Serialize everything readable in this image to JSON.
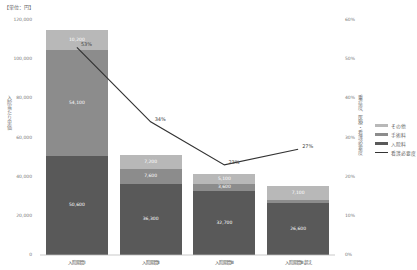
{
  "chart_data": {
    "type": "bar+line",
    "title": "",
    "unit_label": "【単位：円】",
    "ylabel": "入院当たり単価",
    "ylabel_right": "重症度、医療・看護必要度",
    "ylim": [
      0,
      120000
    ],
    "ylim_right": [
      0,
      0.6
    ],
    "yticks": [
      "0",
      "20,000",
      "40,000",
      "60,000",
      "80,000",
      "100,000",
      "120,000"
    ],
    "yticks_right": [
      "0%",
      "10%",
      "20%",
      "30%",
      "40%",
      "50%",
      "60%"
    ],
    "categories": [
      "入院期間Ⅰ",
      "入院期間Ⅱ",
      "入院期間Ⅲ",
      "入院期間Ⅲ超え"
    ],
    "series": [
      {
        "name": "入院料",
        "type": "bar",
        "stack": true,
        "color": "#595959",
        "values": [
          50600,
          36300,
          32700,
          26600
        ],
        "labels": [
          "50,600",
          "36,300",
          "32,700",
          "26,600"
        ]
      },
      {
        "name": "手術料",
        "type": "bar",
        "stack": true,
        "color": "#8c8c8c",
        "values": [
          54100,
          7600,
          3600,
          1500
        ],
        "labels": [
          "54,100",
          "7,600",
          "3,600",
          "1,500"
        ]
      },
      {
        "name": "その他",
        "type": "bar",
        "stack": true,
        "color": "#b8b8b8",
        "values": [
          10200,
          7200,
          5100,
          7100
        ],
        "labels": [
          "10,200",
          "7,200",
          "5,100",
          "7,100"
        ]
      },
      {
        "name": "看護必要度",
        "type": "line",
        "axis": "right",
        "color": "#333333",
        "values": [
          0.53,
          0.34,
          0.23,
          0.27
        ],
        "labels": [
          "53%",
          "34%",
          "23%",
          "27%"
        ]
      }
    ],
    "legend": [
      "その他",
      "手術料",
      "入院料",
      "看護必要度"
    ],
    "legend_position": "right",
    "grid": false
  }
}
